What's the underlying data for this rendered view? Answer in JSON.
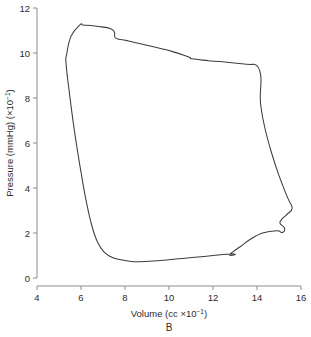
{
  "chart_data": {
    "type": "line",
    "title": "",
    "panel_label": "B",
    "xlabel": "Volume (cc ×10⁻¹)",
    "ylabel": "Pressure (mmHg) (×10⁻¹)",
    "xlabel_parts": {
      "text": "Volume (cc ×10",
      "sup": "−1",
      "tail": ")"
    },
    "ylabel_parts": {
      "text": "Pressure (mmHg) (×10",
      "sup": "−1",
      "tail": ")"
    },
    "xlim": [
      4,
      16
    ],
    "ylim": [
      0,
      12
    ],
    "xticks": [
      4,
      6,
      8,
      10,
      12,
      14,
      16
    ],
    "yticks": [
      0,
      2,
      4,
      6,
      8,
      10,
      12
    ],
    "grid": false,
    "legend": null,
    "series": [
      {
        "name": "pressure-volume loop",
        "closed": true,
        "color": "#3c3c3c",
        "points": [
          [
            6.05,
            11.25
          ],
          [
            5.95,
            11.25
          ],
          [
            5.55,
            10.75
          ],
          [
            5.35,
            9.95
          ],
          [
            5.32,
            9.55
          ],
          [
            5.45,
            8.4
          ],
          [
            5.7,
            6.55
          ],
          [
            6.0,
            4.7
          ],
          [
            6.25,
            3.35
          ],
          [
            6.5,
            2.3
          ],
          [
            6.75,
            1.6
          ],
          [
            7.05,
            1.15
          ],
          [
            7.45,
            0.9
          ],
          [
            8.0,
            0.78
          ],
          [
            8.65,
            0.72
          ],
          [
            9.6,
            0.78
          ],
          [
            10.6,
            0.87
          ],
          [
            11.6,
            0.96
          ],
          [
            12.35,
            1.03
          ],
          [
            12.8,
            1.07
          ],
          [
            13.0,
            1.06
          ],
          [
            12.95,
            1.02
          ],
          [
            12.75,
            1.02
          ],
          [
            12.9,
            1.16
          ],
          [
            13.25,
            1.4
          ],
          [
            13.7,
            1.72
          ],
          [
            14.25,
            2.0
          ],
          [
            14.9,
            2.1
          ],
          [
            15.15,
            2.02
          ],
          [
            15.25,
            2.22
          ],
          [
            15.05,
            2.42
          ],
          [
            15.1,
            2.58
          ],
          [
            15.35,
            2.82
          ],
          [
            15.6,
            3.1
          ],
          [
            15.4,
            3.55
          ],
          [
            15.0,
            4.55
          ],
          [
            14.65,
            5.6
          ],
          [
            14.35,
            6.7
          ],
          [
            14.18,
            7.6
          ],
          [
            14.15,
            8.15
          ],
          [
            14.18,
            8.7
          ],
          [
            14.15,
            9.1
          ],
          [
            13.98,
            9.45
          ],
          [
            13.55,
            9.5
          ],
          [
            12.75,
            9.58
          ],
          [
            11.8,
            9.66
          ],
          [
            11.05,
            9.74
          ],
          [
            10.9,
            9.82
          ],
          [
            10.2,
            10.05
          ],
          [
            9.1,
            10.32
          ],
          [
            8.1,
            10.55
          ],
          [
            7.58,
            10.66
          ],
          [
            7.52,
            10.92
          ],
          [
            7.35,
            11.08
          ],
          [
            6.8,
            11.18
          ],
          [
            6.3,
            11.23
          ],
          [
            6.05,
            11.25
          ]
        ]
      }
    ]
  }
}
